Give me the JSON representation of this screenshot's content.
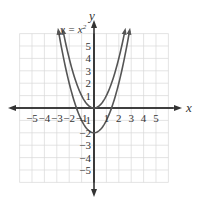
{
  "chart_data": {
    "type": "line",
    "title": "",
    "xlabel": "x",
    "ylabel": "y",
    "xlim": [
      -6,
      6
    ],
    "ylim": [
      -6,
      6
    ],
    "grid": true,
    "x_ticks": [
      -5,
      -4,
      -3,
      -2,
      -1,
      1,
      2,
      3,
      4,
      5
    ],
    "y_ticks": [
      -5,
      -4,
      -3,
      -2,
      -1,
      1,
      2,
      3,
      4,
      5
    ],
    "series": [
      {
        "name": "y = x²",
        "label": "y = x²",
        "expression": "x^2",
        "vertex": [
          0,
          0
        ],
        "color": "#555555"
      },
      {
        "name": "y = x² − 2",
        "label": "",
        "expression": "x^2 - 2",
        "vertex": [
          0,
          -2
        ],
        "color": "#555555"
      }
    ],
    "annotations": [
      {
        "text": "y = x²",
        "position": "upper-left of y-axis, near left arm of y = x²"
      }
    ]
  },
  "labels": {
    "x_axis": "x",
    "y_axis": "y",
    "curve1": "y = x",
    "curve1_exp": "2",
    "xt": [
      "−5",
      "−4",
      "−3",
      "−2",
      "−1",
      "1",
      "2",
      "3",
      "4",
      "5"
    ],
    "yt": [
      "5",
      "4",
      "3",
      "2",
      "1",
      "−1",
      "−2",
      "−3",
      "−4",
      "−5"
    ]
  },
  "colors": {
    "grid": "#d8d8d8",
    "axis": "#333333",
    "curve": "#555555"
  }
}
